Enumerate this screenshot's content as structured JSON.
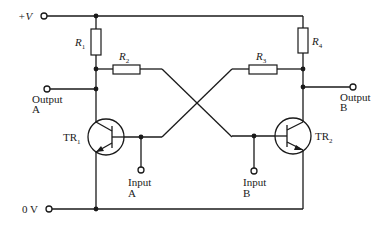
{
  "diagram": {
    "type": "circuit-schematic",
    "rails": {
      "positive": {
        "label": "+V"
      },
      "ground": {
        "label": "0 V"
      }
    },
    "resistors": [
      {
        "id": "R1",
        "label": "R",
        "sub": "1"
      },
      {
        "id": "R2",
        "label": "R",
        "sub": "2"
      },
      {
        "id": "R3",
        "label": "R",
        "sub": "3"
      },
      {
        "id": "R4",
        "label": "R",
        "sub": "4"
      }
    ],
    "transistors": [
      {
        "id": "TR1",
        "label": "TR",
        "sub": "1",
        "type": "npn"
      },
      {
        "id": "TR2",
        "label": "TR",
        "sub": "2",
        "type": "npn"
      }
    ],
    "terminals": {
      "output_a": {
        "line1": "Output",
        "line2": "A"
      },
      "output_b": {
        "line1": "Output",
        "line2": "B"
      },
      "input_a": {
        "line1": "Input",
        "line2": "A"
      },
      "input_b": {
        "line1": "Input",
        "line2": "B"
      }
    },
    "colors": {
      "ink": "#1a1a1a",
      "background": "#ffffff"
    }
  }
}
